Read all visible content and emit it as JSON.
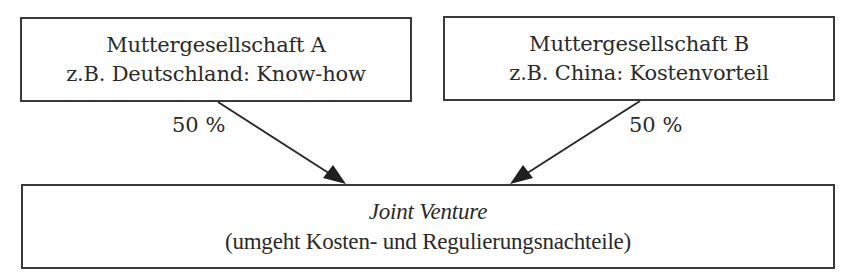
{
  "diagram": {
    "parent_a": {
      "title": "Muttergesellschaft A",
      "subtitle": "z.B. Deutschland: Know-how",
      "share": "50 %"
    },
    "parent_b": {
      "title": "Muttergesellschaft B",
      "subtitle": "z.B. China: Kostenvorteil",
      "share": "50 %"
    },
    "joint_venture": {
      "title": "Joint Venture",
      "subtitle": "(umgeht Kosten- und Regulierungsnachteile)"
    },
    "edges": [
      {
        "from": "parent_a",
        "to": "joint_venture",
        "label": "50 %"
      },
      {
        "from": "parent_b",
        "to": "joint_venture",
        "label": "50 %"
      }
    ],
    "colors": {
      "stroke": "#3a3a3a",
      "text": "#2a2a2a",
      "background": "#ffffff"
    }
  }
}
